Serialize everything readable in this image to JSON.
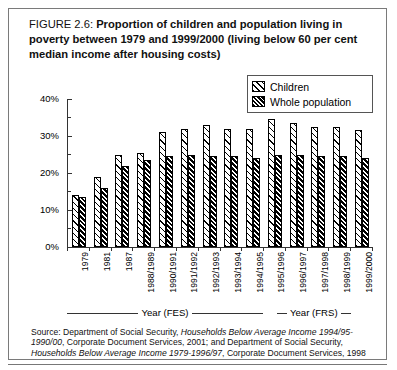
{
  "figure": {
    "number": "FIGURE 2.6:",
    "caption": "Proportion of children and population living in poverty between 1979 and 1999/2000 (living below 60 per cent median income after housing costs)"
  },
  "legend": {
    "items": [
      {
        "label": "Children",
        "pattern": "sparse-diagonal-hatch"
      },
      {
        "label": "Whole population",
        "pattern": "dense-diagonal-hatch"
      }
    ]
  },
  "axis_groups": [
    {
      "label": "Year (FES)"
    },
    {
      "label": "Year (FRS)"
    }
  ],
  "source": {
    "line1_plain_a": "Source: Department of Social Security, ",
    "line1_italic_a": "Households Below Average Income 1994/95-1990/00",
    "line1_plain_b": ", Corporate Document Services, 2001; and Department of Social Security, ",
    "line1_italic_b": "Households Below Average Income 1979-1996/97",
    "line1_plain_c": ", Corporate Document Services, 1998"
  },
  "chart_data": {
    "type": "bar",
    "title": "Proportion of children and population living in poverty between 1979 and 1999/2000 (living below 60 per cent median income after housing costs)",
    "xlabel": "Year",
    "ylabel": "",
    "ylim": [
      0,
      40
    ],
    "ytick_labels": [
      "0%",
      "10%",
      "20%",
      "30%",
      "40%"
    ],
    "ytick_values": [
      0,
      10,
      20,
      30,
      40
    ],
    "yminor_values": [
      5,
      15,
      25,
      35
    ],
    "grid": false,
    "legend_position": "top-right",
    "categories": [
      "1979",
      "1981",
      "1987",
      "1988/1989",
      "1990/1991",
      "1991/1992",
      "1992/1993",
      "1993/1994",
      "1994/1995",
      "1995/1996",
      "1996/1997",
      "1997/1998",
      "1998/1999",
      "1999/2000"
    ],
    "series": [
      {
        "name": "Children",
        "values": [
          14,
          19,
          25,
          25.5,
          31,
          32,
          33,
          32,
          32,
          34.5,
          33.5,
          32.5,
          32.5,
          31.5
        ]
      },
      {
        "name": "Whole population",
        "values": [
          13.5,
          16,
          22,
          23.5,
          24.5,
          25,
          24.5,
          24.5,
          24,
          25,
          25,
          24.5,
          24.5,
          24
        ]
      }
    ]
  }
}
